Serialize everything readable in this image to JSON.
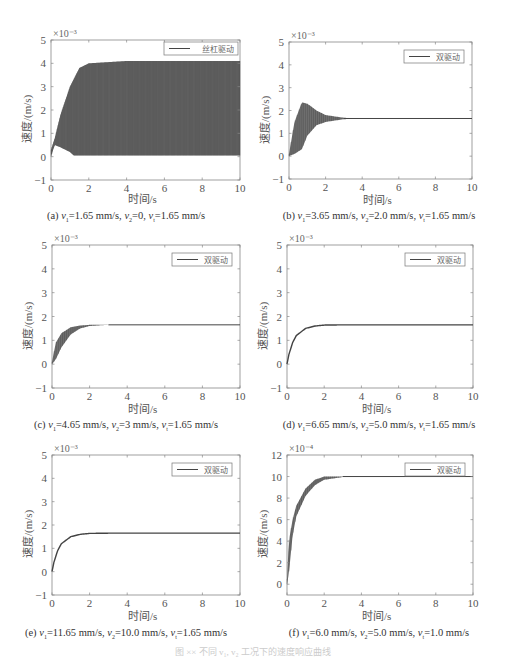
{
  "figure_caption": "图 ×× 不同 v₁, v₂ 工况下的速度响应曲线",
  "chart_data": [
    {
      "id": "a",
      "type": "line",
      "caption_prefix": "(a) ",
      "caption": "(a) v1=1.65 mm/s, v2=0, vt=1.65 mm/s",
      "caption_parts": [
        "(a) ",
        "v",
        "1",
        "=1.65 mm/s, ",
        "v",
        "2",
        "=0, ",
        "v",
        "t",
        "=1.65 mm/s"
      ],
      "xlabel": "时间/s",
      "ylabel": "速度/(m/s)",
      "exponent": "×10⁻³",
      "xlim": [
        0,
        10
      ],
      "ylim": [
        -1,
        5
      ],
      "xticks": [
        "0",
        "2",
        "4",
        "6",
        "8",
        "10"
      ],
      "yticks": [
        "-1",
        "0",
        "1",
        "2",
        "3",
        "4",
        "5"
      ],
      "legend": "丝杠驱动",
      "grid": false,
      "behavior": "sustained oscillation",
      "series": [
        {
          "name": "丝杠驱动 upper envelope",
          "x": [
            0,
            0.2,
            0.5,
            1.0,
            1.5,
            2.0,
            4.0,
            6.0,
            8.0,
            10.0
          ],
          "values": [
            0.3,
            0.8,
            1.8,
            3.0,
            3.8,
            4.0,
            4.1,
            4.1,
            4.1,
            4.1
          ]
        },
        {
          "name": "丝杠驱动 lower envelope",
          "x": [
            0,
            0.2,
            0.5,
            1.0,
            1.2,
            2.0,
            4.0,
            6.0,
            8.0,
            10.0
          ],
          "values": [
            0.0,
            0.5,
            0.4,
            0.2,
            0.05,
            0.05,
            0.05,
            0.05,
            0.05,
            0.05
          ]
        }
      ]
    },
    {
      "id": "b",
      "type": "line",
      "caption": "(b) v1=3.65 mm/s, v2=2.0 mm/s, vt=1.65 mm/s",
      "caption_parts": [
        "(b) ",
        "v",
        "1",
        "=3.65 mm/s, ",
        "v",
        "2",
        "=2.0 mm/s, ",
        "v",
        "t",
        "=1.65 mm/s"
      ],
      "xlabel": "时间/s",
      "ylabel": "速度/(m/s)",
      "exponent": "×10⁻³",
      "xlim": [
        0,
        10
      ],
      "ylim": [
        -1,
        5
      ],
      "xticks": [
        "0",
        "2",
        "4",
        "6",
        "8",
        "10"
      ],
      "yticks": [
        "-1",
        "0",
        "1",
        "2",
        "3",
        "4",
        "5"
      ],
      "legend": "双驱动",
      "grid": false,
      "steady_state": 1.65,
      "series": [
        {
          "name": "双驱动 upper envelope",
          "x": [
            0,
            0.3,
            0.7,
            1.0,
            1.5,
            2.0,
            3.0,
            4.0,
            10.0
          ],
          "values": [
            0.1,
            1.5,
            2.35,
            2.3,
            2.0,
            1.8,
            1.68,
            1.65,
            1.65
          ]
        },
        {
          "name": "双驱动 lower envelope",
          "x": [
            0,
            0.3,
            0.7,
            1.0,
            1.5,
            2.0,
            3.0,
            4.0,
            10.0
          ],
          "values": [
            0.0,
            0.1,
            0.3,
            0.9,
            1.35,
            1.5,
            1.62,
            1.65,
            1.65
          ]
        }
      ]
    },
    {
      "id": "c",
      "type": "line",
      "caption": "(c) v1=4.65 mm/s, v2=3 mm/s, vt=1.65 mm/s",
      "caption_parts": [
        "(c) ",
        "v",
        "1",
        "=4.65 mm/s, ",
        "v",
        "2",
        "=3 mm/s, ",
        "v",
        "t",
        "=1.65 mm/s"
      ],
      "xlabel": "时间/s",
      "ylabel": "速度/(m/s)",
      "exponent": "×10⁻³",
      "xlim": [
        0,
        10
      ],
      "ylim": [
        -1,
        5
      ],
      "xticks": [
        "0",
        "2",
        "4",
        "6",
        "8",
        "10"
      ],
      "yticks": [
        "-1",
        "0",
        "1",
        "2",
        "3",
        "4",
        "5"
      ],
      "legend": "双驱动",
      "grid": false,
      "steady_state": 1.65,
      "series": [
        {
          "name": "双驱动 upper envelope",
          "x": [
            0,
            0.2,
            0.5,
            1.0,
            1.5,
            2.0,
            3.0,
            10.0
          ],
          "values": [
            0.1,
            0.9,
            1.3,
            1.55,
            1.62,
            1.65,
            1.65,
            1.65
          ]
        },
        {
          "name": "双驱动 lower envelope",
          "x": [
            0,
            0.2,
            0.5,
            1.0,
            1.5,
            2.0,
            3.0,
            10.0
          ],
          "values": [
            0.0,
            0.2,
            0.7,
            1.25,
            1.5,
            1.6,
            1.65,
            1.65
          ]
        }
      ]
    },
    {
      "id": "d",
      "type": "line",
      "caption": "(d) v1=6.65 mm/s, v2=5.0 mm/s, vt=1.65 mm/s",
      "caption_parts": [
        "(d) ",
        "v",
        "1",
        "=6.65 mm/s, ",
        "v",
        "2",
        "=5.0 mm/s, ",
        "v",
        "t",
        "=1.65 mm/s"
      ],
      "xlabel": "时间/s",
      "ylabel": "速度/(m/s)",
      "exponent": "×10⁻³",
      "xlim": [
        0,
        10
      ],
      "ylim": [
        -1,
        5
      ],
      "xticks": [
        "0",
        "2",
        "4",
        "6",
        "8",
        "10"
      ],
      "yticks": [
        "-1",
        "0",
        "1",
        "2",
        "3",
        "4",
        "5"
      ],
      "legend": "双驱动",
      "grid": false,
      "steady_state": 1.65,
      "series": [
        {
          "name": "双驱动",
          "x": [
            0,
            0.1,
            0.3,
            0.5,
            1.0,
            1.5,
            2.0,
            3.0,
            10.0
          ],
          "values": [
            0.0,
            0.4,
            0.9,
            1.2,
            1.5,
            1.6,
            1.64,
            1.65,
            1.65
          ]
        }
      ]
    },
    {
      "id": "e",
      "type": "line",
      "caption": "(e) v1=11.65 mm/s, v2=10.0 mm/s, vt=1.65 mm/s",
      "caption_parts": [
        "(e) ",
        "v",
        "1",
        "=11.65 mm/s, ",
        "v",
        "2",
        "=10.0 mm/s, ",
        "v",
        "t",
        "=1.65 mm/s"
      ],
      "xlabel": "时间/s",
      "ylabel": "速度/(m/s)",
      "exponent": "×10⁻³",
      "xlim": [
        0,
        10
      ],
      "ylim": [
        -1,
        5
      ],
      "xticks": [
        "0",
        "2",
        "4",
        "6",
        "8",
        "10"
      ],
      "yticks": [
        "-1",
        "0",
        "1",
        "2",
        "3",
        "4",
        "5"
      ],
      "legend": "双驱动",
      "grid": false,
      "steady_state": 1.65,
      "series": [
        {
          "name": "双驱动",
          "x": [
            0,
            0.1,
            0.3,
            0.5,
            1.0,
            1.5,
            2.0,
            3.0,
            10.0
          ],
          "values": [
            0.0,
            0.4,
            0.9,
            1.2,
            1.5,
            1.6,
            1.64,
            1.65,
            1.65
          ]
        }
      ]
    },
    {
      "id": "f",
      "type": "line",
      "caption": "(f) v1=6.0 mm/s, v2=5.0 mm/s, vt=1.0 mm/s",
      "caption_parts": [
        "(f) ",
        "v",
        "1",
        "=6.0 mm/s, ",
        "v",
        "2",
        "=5.0 mm/s, ",
        "v",
        "t",
        "=1.0 mm/s"
      ],
      "xlabel": "时间/s",
      "ylabel": "速度/(m/s)",
      "exponent": "×10⁻⁴",
      "xlim": [
        0,
        10
      ],
      "ylim": [
        -1,
        12
      ],
      "xticks": [
        "0",
        "2",
        "4",
        "6",
        "8",
        "10"
      ],
      "yticks": [
        "0",
        "2",
        "4",
        "6",
        "8",
        "10",
        "12"
      ],
      "legend": "双驱动",
      "grid": false,
      "steady_state": 10,
      "series": [
        {
          "name": "双驱动 upper envelope",
          "x": [
            0,
            0.1,
            0.3,
            0.5,
            1.0,
            1.5,
            2.0,
            3.0,
            4.0,
            10.0
          ],
          "values": [
            0.5,
            4.0,
            6.0,
            7.3,
            8.9,
            9.7,
            10.0,
            10.0,
            10.0,
            10.0
          ]
        },
        {
          "name": "双驱动 lower envelope",
          "x": [
            0,
            0.1,
            0.3,
            0.5,
            1.0,
            1.5,
            2.0,
            3.0,
            4.0,
            10.0
          ],
          "values": [
            0.0,
            1.0,
            4.5,
            6.3,
            8.2,
            9.2,
            9.7,
            9.95,
            10.0,
            10.0
          ]
        }
      ]
    }
  ]
}
